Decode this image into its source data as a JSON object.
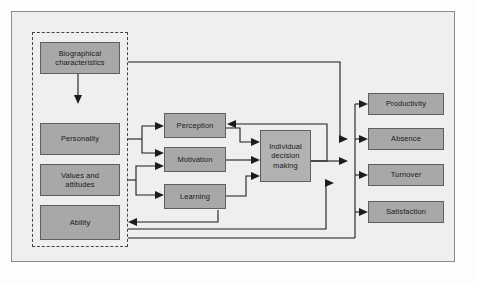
{
  "diagram": {
    "title_visible": false,
    "type": "organizational-behavior-model",
    "colors": {
      "node_fill": "#a8a8a8",
      "node_fill_light": "#b2b2b2",
      "node_border": "#5f5f5f",
      "canvas_bg": "#efefef",
      "frame_border": "#8c8c8c",
      "group_border": "#444444",
      "connector": "#1c1c1c"
    },
    "group": {
      "name": "individual-inputs-group",
      "style": "dashed"
    },
    "inputs": [
      {
        "id": "biographical",
        "label": "Biographical\ncharacteristics"
      },
      {
        "id": "personality",
        "label": "Personality"
      },
      {
        "id": "values",
        "label": "Values and\nattitudes"
      },
      {
        "id": "ability",
        "label": "Ability"
      }
    ],
    "processes": [
      {
        "id": "perception",
        "label": "Perception"
      },
      {
        "id": "motivation",
        "label": "Motivation"
      },
      {
        "id": "learning",
        "label": "Learning"
      }
    ],
    "decision": {
      "id": "decision",
      "label": "Individual\ndecision\nmaking"
    },
    "outcomes": [
      {
        "id": "productivity",
        "label": "Productivity"
      },
      {
        "id": "absence",
        "label": "Absence"
      },
      {
        "id": "turnover",
        "label": "Turnover"
      },
      {
        "id": "satisfaction",
        "label": "Satisfaction"
      }
    ]
  }
}
